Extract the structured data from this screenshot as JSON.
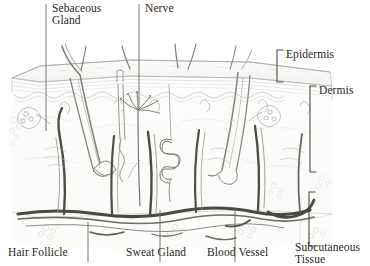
{
  "figure": {
    "kind": "anatomical-cross-section",
    "style": "pencil sketch, graphite on white",
    "background_color": "#ffffff",
    "ink_color": "#2b2724",
    "leader_color": "#5d5955"
  },
  "labels": {
    "sebaceous_gland": "Sebaceous\nGland",
    "nerve": "Nerve",
    "epidermis": "Epidermis",
    "dermis": "Dermis",
    "hair_follicle": "Hair Follicle",
    "sweat_gland": "Sweat Gland",
    "blood_vessel": "Blood Vessel",
    "subcutaneous_tissue": "Subcutaneous\nTissue"
  },
  "callouts": [
    {
      "name": "sebaceous-gland",
      "text": "Sebaceous Gland",
      "position": "top-left",
      "leader": "vertical-line-down"
    },
    {
      "name": "nerve",
      "text": "Nerve",
      "position": "top-center",
      "leader": "vertical-line-down"
    },
    {
      "name": "epidermis",
      "text": "Epidermis",
      "position": "right-upper",
      "leader": "bracket-left"
    },
    {
      "name": "dermis",
      "text": "Dermis",
      "position": "right-middle",
      "leader": "bracket-left"
    },
    {
      "name": "subcutaneous-tissue",
      "text": "Subcutaneous Tissue",
      "position": "right-lower",
      "leader": "bracket-left"
    },
    {
      "name": "hair-follicle",
      "text": "Hair Follicle",
      "position": "bottom-left",
      "leader": "vertical-line-up"
    },
    {
      "name": "sweat-gland",
      "text": "Sweat Gland",
      "position": "bottom-center",
      "leader": "vertical-line-up"
    },
    {
      "name": "blood-vessel",
      "text": "Blood Vessel",
      "position": "bottom-center-right",
      "leader": "vertical-line-up"
    }
  ],
  "structures": [
    {
      "name": "hair-shaft",
      "count": 7,
      "region": "above epidermis"
    },
    {
      "name": "epidermis-layer",
      "region": "surface slab"
    },
    {
      "name": "dermis-layer",
      "region": "middle"
    },
    {
      "name": "subcutaneous-layer",
      "region": "bottom"
    },
    {
      "name": "hair-follicle",
      "count": 2,
      "region": "dermis"
    },
    {
      "name": "sebaceous-gland",
      "count": 2,
      "region": "upper dermis"
    },
    {
      "name": "sweat-gland-coil",
      "count": 1,
      "region": "mid dermis"
    },
    {
      "name": "sweat-duct",
      "count": 1,
      "region": "epidermis to dermis"
    },
    {
      "name": "nerve-ending",
      "count": 1,
      "region": "upper dermis"
    },
    {
      "name": "blood-vessel-vertical",
      "count": 5,
      "region": "dermis"
    },
    {
      "name": "blood-vessel-horizontal",
      "count": 3,
      "region": "dermis-subcutaneous boundary"
    },
    {
      "name": "fat-lobule",
      "count": 6,
      "region": "subcutaneous tissue"
    }
  ]
}
